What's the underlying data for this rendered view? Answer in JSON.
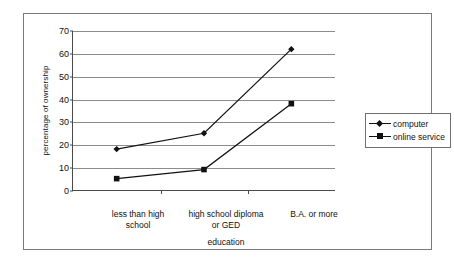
{
  "chart_data": {
    "type": "line",
    "title": "",
    "subtitle": "",
    "xlabel": "education",
    "ylabel": "percentage of ownership",
    "categories": [
      "less than high school",
      "high school diploma or GED",
      "B.A. or more"
    ],
    "category_lines": [
      [
        "less than high",
        "school"
      ],
      [
        "high school diploma",
        "or GED"
      ],
      [
        "B.A. or more",
        ""
      ]
    ],
    "series": [
      {
        "name": "computer",
        "marker": "diamond",
        "color": "#111111",
        "values": [
          18,
          25,
          62
        ]
      },
      {
        "name": "online service",
        "marker": "square",
        "color": "#111111",
        "values": [
          5,
          9,
          38
        ]
      }
    ],
    "ylim": [
      0,
      70
    ],
    "ytick_step": 10,
    "yticks": [
      0,
      10,
      20,
      30,
      40,
      50,
      60,
      70
    ],
    "ytick_labels": [
      "0",
      "10",
      "20",
      "30",
      "40",
      "50",
      "60",
      "70"
    ],
    "grid": "horizontal",
    "legend_position": "right",
    "legend_entries": [
      "computer",
      "online service"
    ],
    "frame": true
  },
  "colors": {
    "background": "#ffffff",
    "frame": "#7a7a7a",
    "axis": "#4a4a4a",
    "gridline": "#8c8c8c",
    "series": "#111111",
    "text": "#101010"
  }
}
